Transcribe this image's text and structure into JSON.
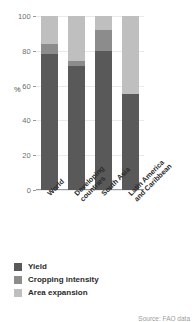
{
  "chart_data": {
    "type": "bar",
    "title": "",
    "subtitle": "",
    "xlabel": "",
    "ylabel": "%",
    "ylim": [
      0,
      100
    ],
    "yticks": [
      0,
      20,
      40,
      60,
      80,
      100
    ],
    "ytick_labels": [
      "0",
      "20",
      "40",
      "60",
      "80",
      "100"
    ],
    "grid": true,
    "stacked": true,
    "stack_total": 100,
    "legend_position": "below-left",
    "categories": [
      "World",
      "Developing countries",
      "South Asia",
      "Latin America and Caribbean"
    ],
    "category_lines": [
      [
        "World"
      ],
      [
        "Developing",
        "countries"
      ],
      [
        "South Asia"
      ],
      [
        "Latin America",
        "and Caribbean"
      ]
    ],
    "series": [
      {
        "name": "Yield",
        "color": "#595959",
        "values": [
          78,
          71,
          80,
          55
        ]
      },
      {
        "name": "Cropping intensity",
        "color": "#8c8c8c",
        "values": [
          6,
          3,
          12,
          0
        ]
      },
      {
        "name": "Area expansion",
        "color": "#bfbfbf",
        "values": [
          16,
          26,
          8,
          45
        ]
      }
    ],
    "annotations": {
      "source": "Source: FAO data"
    }
  },
  "axes": {
    "y_axis_title": "%"
  },
  "legend": {
    "items": [
      {
        "label": "Yield",
        "color": "#595959"
      },
      {
        "label": "Cropping intensity",
        "color": "#8c8c8c"
      },
      {
        "label": "Area expansion",
        "color": "#bfbfbf"
      }
    ]
  },
  "footer": {
    "source_text": "Source: FAO data"
  }
}
